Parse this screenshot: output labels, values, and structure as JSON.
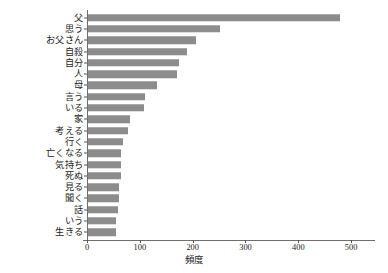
{
  "chart_data": {
    "type": "bar",
    "orientation": "horizontal",
    "title": "",
    "xlabel": "頻度",
    "ylabel": "",
    "xlim": [
      0,
      530
    ],
    "xticks": [
      0,
      100,
      200,
      300,
      400,
      500
    ],
    "xtick_labels": [
      "0",
      "100",
      "200",
      "300",
      "400",
      "500"
    ],
    "grid": false,
    "legend": false,
    "bar_color": "#8c8c8c",
    "axis_color": "#6e6e6e",
    "categories": [
      "父",
      "思う",
      "お父さん",
      "自殺",
      "自分",
      "人",
      "母",
      "言う",
      "いる",
      "家",
      "考える",
      "行く",
      "亡くなる",
      "気持ち",
      "死ぬ",
      "見る",
      "聞く",
      "話",
      "いう",
      "生きる"
    ],
    "values": [
      478,
      252,
      206,
      190,
      174,
      170,
      133,
      110,
      107,
      82,
      77,
      68,
      64,
      64,
      64,
      61,
      60,
      58,
      55,
      54
    ]
  }
}
